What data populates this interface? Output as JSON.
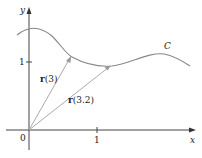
{
  "figure": {
    "axes": {
      "x_label": "x",
      "y_label": "y",
      "origin_label": "0",
      "x_tick_label": "1",
      "y_tick_label": "1"
    },
    "curve": {
      "label": "C"
    },
    "vectors": [
      {
        "name": "r",
        "arg": "(3)"
      },
      {
        "name": "r",
        "arg": "(3.2)"
      }
    ],
    "colors": {
      "axis": "#444444",
      "curve": "#888888",
      "vector": "#aaaaaa",
      "text": "#222222"
    }
  }
}
